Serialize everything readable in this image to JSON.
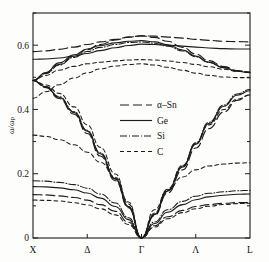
{
  "figure": {
    "name": "phonon-dispersion-figure",
    "kind": "line-plot"
  },
  "axes": {
    "y_title": "ω/ωₚ",
    "y_title_plain": "omega / omega_p",
    "y_ticks": [
      "0",
      "0.2",
      "0.4",
      "0.6"
    ],
    "y_tick_values": [
      0,
      0.2,
      0.4,
      0.6
    ],
    "y_minor_tick_values": [
      0.1,
      0.3,
      0.5,
      0.7
    ],
    "x_ticks": [
      "X",
      "Δ",
      "Γ",
      "Λ",
      "L"
    ],
    "x_tick_values": [
      0,
      0.25,
      0.5,
      0.75,
      1.0
    ]
  },
  "legend": {
    "position": "center",
    "items": [
      {
        "label": "α–Sn",
        "dash": "9,4",
        "width": 1.15
      },
      {
        "label": "Ge",
        "dash": "none",
        "width": 1.15
      },
      {
        "label": "Si",
        "dash": "7,2,1,2",
        "width": 1.05
      },
      {
        "label": "C",
        "dash": "4,3",
        "width": 1.05
      }
    ]
  },
  "chart_data": {
    "type": "line",
    "title": "",
    "xlabel": "",
    "ylabel": "ω/ωₚ",
    "xlim": [
      0,
      1
    ],
    "ylim": [
      0,
      0.7
    ],
    "grid": false,
    "legend_position": "center",
    "x_tick_labels": [
      "X",
      "Δ",
      "Γ",
      "Λ",
      "L"
    ],
    "x_tick_positions": [
      0,
      0.25,
      0.5,
      0.75,
      1.0
    ],
    "y_tick_labels": [
      "0",
      "0.2",
      "0.4",
      "0.6"
    ],
    "y_tick_positions": [
      0,
      0.2,
      0.4,
      0.6
    ],
    "note": "x runs X -> Delta -> Gamma -> Lambda -> L; Gamma at x=0.5",
    "series": [
      {
        "name": "α–Sn",
        "dash": "9,4",
        "width": 1.15,
        "branches": [
          {
            "branch": "LO/TO-upper",
            "x": [
              0.0,
              0.06,
              0.12,
              0.19,
              0.25,
              0.31,
              0.38,
              0.44,
              0.5,
              0.56,
              0.62,
              0.69,
              0.75,
              0.81,
              0.88,
              0.94,
              1.0
            ],
            "y": [
              0.58,
              0.582,
              0.587,
              0.594,
              0.602,
              0.61,
              0.618,
              0.625,
              0.629,
              0.628,
              0.625,
              0.622,
              0.618,
              0.615,
              0.612,
              0.611,
              0.61
            ]
          },
          {
            "branch": "TO-lower",
            "x": [
              0.0,
              0.06,
              0.12,
              0.19,
              0.25,
              0.31,
              0.38,
              0.44,
              0.5,
              0.56,
              0.62,
              0.69,
              0.75,
              0.81,
              0.88,
              0.94,
              1.0
            ],
            "y": [
              0.49,
              0.513,
              0.54,
              0.566,
              0.586,
              0.602,
              0.616,
              0.625,
              0.629,
              0.624,
              0.612,
              0.593,
              0.572,
              0.552,
              0.533,
              0.521,
              0.516
            ]
          },
          {
            "branch": "LA",
            "x": [
              0.0,
              0.06,
              0.12,
              0.19,
              0.25,
              0.31,
              0.38,
              0.44,
              0.5,
              0.56,
              0.62,
              0.69,
              0.75,
              0.81,
              0.88,
              0.94,
              1.0
            ],
            "y": [
              0.49,
              0.468,
              0.434,
              0.385,
              0.325,
              0.255,
              0.178,
              0.094,
              0.0,
              0.07,
              0.14,
              0.212,
              0.28,
              0.34,
              0.392,
              0.428,
              0.445
            ]
          },
          {
            "branch": "TA",
            "x": [
              0.0,
              0.06,
              0.12,
              0.19,
              0.25,
              0.31,
              0.38,
              0.44,
              0.5,
              0.56,
              0.62,
              0.69,
              0.75,
              0.81,
              0.88,
              0.94,
              1.0
            ],
            "y": [
              0.135,
              0.134,
              0.131,
              0.126,
              0.118,
              0.104,
              0.083,
              0.049,
              0.0,
              0.038,
              0.066,
              0.086,
              0.098,
              0.104,
              0.108,
              0.11,
              0.11
            ]
          }
        ]
      },
      {
        "name": "Ge",
        "dash": "none",
        "width": 1.15,
        "branches": [
          {
            "branch": "LO/TO-upper",
            "x": [
              0.0,
              0.06,
              0.12,
              0.19,
              0.25,
              0.31,
              0.38,
              0.44,
              0.5,
              0.56,
              0.62,
              0.69,
              0.75,
              0.81,
              0.88,
              0.94,
              1.0
            ],
            "y": [
              0.556,
              0.557,
              0.56,
              0.566,
              0.574,
              0.583,
              0.592,
              0.599,
              0.603,
              0.602,
              0.6,
              0.597,
              0.594,
              0.591,
              0.589,
              0.588,
              0.588
            ]
          },
          {
            "branch": "TO-lower",
            "x": [
              0.0,
              0.06,
              0.12,
              0.19,
              0.25,
              0.31,
              0.38,
              0.44,
              0.5,
              0.56,
              0.62,
              0.69,
              0.75,
              0.81,
              0.88,
              0.94,
              1.0
            ],
            "y": [
              0.49,
              0.515,
              0.545,
              0.57,
              0.588,
              0.599,
              0.607,
              0.612,
              0.614,
              0.61,
              0.601,
              0.585,
              0.566,
              0.547,
              0.53,
              0.519,
              0.514
            ]
          },
          {
            "branch": "LA",
            "x": [
              0.0,
              0.06,
              0.12,
              0.19,
              0.25,
              0.31,
              0.38,
              0.44,
              0.5,
              0.56,
              0.62,
              0.69,
              0.75,
              0.81,
              0.88,
              0.94,
              1.0
            ],
            "y": [
              0.49,
              0.47,
              0.438,
              0.39,
              0.332,
              0.262,
              0.183,
              0.097,
              0.0,
              0.073,
              0.146,
              0.221,
              0.292,
              0.356,
              0.41,
              0.444,
              0.458
            ]
          },
          {
            "branch": "TA",
            "x": [
              0.0,
              0.06,
              0.12,
              0.19,
              0.25,
              0.31,
              0.38,
              0.44,
              0.5,
              0.56,
              0.62,
              0.69,
              0.75,
              0.81,
              0.88,
              0.94,
              1.0
            ],
            "y": [
              0.16,
              0.159,
              0.156,
              0.15,
              0.14,
              0.124,
              0.098,
              0.057,
              0.0,
              0.045,
              0.08,
              0.104,
              0.119,
              0.128,
              0.133,
              0.136,
              0.137
            ]
          }
        ]
      },
      {
        "name": "Si",
        "dash": "7,2,1,2",
        "width": 1.05,
        "branches": [
          {
            "branch": "TO-lower",
            "x": [
              0.0,
              0.06,
              0.12,
              0.19,
              0.25,
              0.31,
              0.38,
              0.44,
              0.5,
              0.56,
              0.62,
              0.69,
              0.75,
              0.81,
              0.88,
              0.94,
              1.0
            ],
            "y": [
              0.49,
              0.512,
              0.538,
              0.562,
              0.58,
              0.593,
              0.602,
              0.608,
              0.61,
              0.606,
              0.597,
              0.582,
              0.564,
              0.546,
              0.53,
              0.52,
              0.515
            ]
          },
          {
            "branch": "LA",
            "x": [
              0.0,
              0.06,
              0.12,
              0.19,
              0.25,
              0.31,
              0.38,
              0.44,
              0.5,
              0.56,
              0.62,
              0.69,
              0.75,
              0.81,
              0.88,
              0.94,
              1.0
            ],
            "y": [
              0.49,
              0.471,
              0.44,
              0.393,
              0.335,
              0.265,
              0.185,
              0.098,
              0.0,
              0.074,
              0.148,
              0.224,
              0.296,
              0.36,
              0.414,
              0.448,
              0.462
            ]
          },
          {
            "branch": "TA",
            "x": [
              0.0,
              0.06,
              0.12,
              0.19,
              0.25,
              0.31,
              0.38,
              0.44,
              0.5,
              0.56,
              0.62,
              0.69,
              0.75,
              0.81,
              0.88,
              0.94,
              1.0
            ],
            "y": [
              0.178,
              0.177,
              0.173,
              0.166,
              0.155,
              0.137,
              0.109,
              0.063,
              0.0,
              0.05,
              0.088,
              0.114,
              0.13,
              0.139,
              0.144,
              0.147,
              0.148
            ]
          }
        ]
      },
      {
        "name": "C",
        "dash": "4,3",
        "width": 1.05,
        "branches": [
          {
            "branch": "TO-upper",
            "x": [
              0.0,
              0.06,
              0.12,
              0.19,
              0.25,
              0.31,
              0.38,
              0.44,
              0.5,
              0.56,
              0.62,
              0.69,
              0.75,
              0.81,
              0.88,
              0.94,
              1.0
            ],
            "y": [
              0.49,
              0.506,
              0.522,
              0.534,
              0.542,
              0.547,
              0.551,
              0.554,
              0.555,
              0.554,
              0.551,
              0.546,
              0.54,
              0.533,
              0.525,
              0.519,
              0.516
            ]
          },
          {
            "branch": "TO-lower",
            "x": [
              0.0,
              0.06,
              0.12,
              0.19,
              0.25,
              0.31,
              0.38,
              0.44,
              0.5,
              0.56,
              0.62,
              0.69,
              0.75,
              0.81,
              0.88,
              0.94,
              1.0
            ],
            "y": [
              0.435,
              0.455,
              0.477,
              0.498,
              0.514,
              0.526,
              0.535,
              0.54,
              0.542,
              0.538,
              0.531,
              0.522,
              0.513,
              0.506,
              0.501,
              0.499,
              0.499
            ]
          },
          {
            "branch": "LA",
            "x": [
              0.0,
              0.06,
              0.12,
              0.19,
              0.25,
              0.31,
              0.38,
              0.44,
              0.5,
              0.56,
              0.62,
              0.69,
              0.75,
              0.81,
              0.88,
              0.94,
              1.0
            ],
            "y": [
              0.49,
              0.476,
              0.45,
              0.408,
              0.352,
              0.282,
              0.199,
              0.106,
              0.0,
              0.078,
              0.152,
              0.226,
              0.293,
              0.352,
              0.4,
              0.432,
              0.445
            ]
          },
          {
            "branch": "TA-upper",
            "x": [
              0.0,
              0.06,
              0.12,
              0.19,
              0.25,
              0.31,
              0.38,
              0.44,
              0.5,
              0.56,
              0.62,
              0.69,
              0.75,
              0.81,
              0.88,
              0.94,
              1.0
            ],
            "y": [
              0.32,
              0.316,
              0.306,
              0.29,
              0.267,
              0.236,
              0.189,
              0.112,
              0.0,
              0.088,
              0.15,
              0.19,
              0.212,
              0.224,
              0.23,
              0.233,
              0.234
            ]
          },
          {
            "branch": "TA-lower",
            "x": [
              0.0,
              0.06,
              0.12,
              0.19,
              0.25,
              0.31,
              0.38,
              0.44,
              0.5,
              0.56,
              0.62,
              0.69,
              0.75,
              0.81,
              0.88,
              0.94,
              1.0
            ],
            "y": [
              0.118,
              0.117,
              0.115,
              0.11,
              0.103,
              0.091,
              0.072,
              0.042,
              0.0,
              0.034,
              0.06,
              0.079,
              0.091,
              0.099,
              0.104,
              0.107,
              0.108
            ]
          }
        ]
      }
    ]
  }
}
